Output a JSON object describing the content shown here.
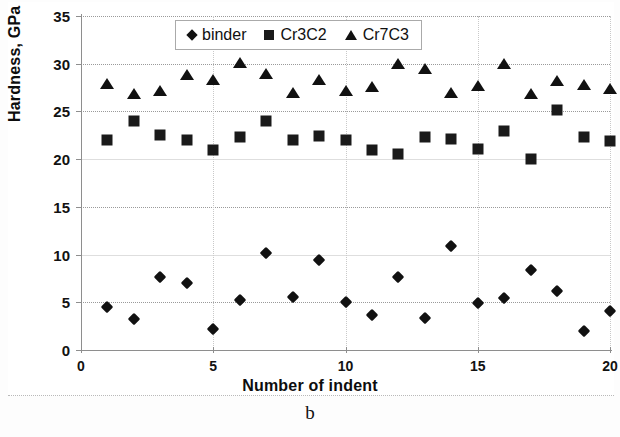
{
  "figure": {
    "caption": "b",
    "background_color": "#ffffff"
  },
  "chart_data": {
    "type": "scatter",
    "title": "",
    "xlabel": "Number of indent",
    "ylabel": "Hardness, GPa",
    "xlim": [
      0,
      20
    ],
    "ylim": [
      0,
      35
    ],
    "xticks": [
      0,
      5,
      10,
      15,
      20
    ],
    "yticks": [
      0,
      5,
      10,
      15,
      20,
      25,
      30,
      35
    ],
    "grid": true,
    "legend_position": "top-center",
    "x": [
      1,
      2,
      3,
      4,
      5,
      6,
      7,
      8,
      9,
      10,
      11,
      12,
      13,
      14,
      15,
      16,
      17,
      18,
      19,
      20
    ],
    "series": [
      {
        "name": "binder",
        "marker": "diamond",
        "color": "#111111",
        "values": [
          4.5,
          3.3,
          7.6,
          7.0,
          2.2,
          5.2,
          10.2,
          5.6,
          9.4,
          5.0,
          3.7,
          7.7,
          3.4,
          10.9,
          4.9,
          5.4,
          8.4,
          6.2,
          2.0,
          4.1
        ]
      },
      {
        "name": "Cr3C2",
        "marker": "square",
        "color": "#1a1a1a",
        "values": [
          22.0,
          24.0,
          22.5,
          22.0,
          21.0,
          22.3,
          24.0,
          22.0,
          22.4,
          22.0,
          21.0,
          20.5,
          22.3,
          22.1,
          21.1,
          22.9,
          20.0,
          25.2,
          22.3,
          21.9
        ]
      },
      {
        "name": "Cr7C3",
        "marker": "triangle",
        "color": "#111111",
        "values": [
          27.9,
          26.8,
          27.1,
          28.8,
          28.3,
          30.1,
          28.9,
          26.9,
          28.3,
          27.1,
          27.6,
          30.0,
          29.4,
          26.9,
          27.7,
          30.0,
          26.8,
          28.2,
          27.8,
          27.3
        ]
      }
    ]
  }
}
